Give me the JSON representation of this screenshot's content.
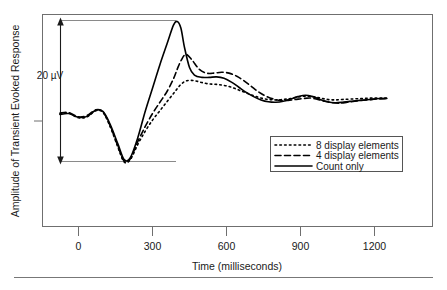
{
  "figure": {
    "background_color": "#ffffff",
    "border_color": "#6f6f6f",
    "trace_color": "#000000"
  },
  "axes": {
    "x_title": "Time (milliseconds)",
    "y_title": "Amplitude of Transient Evoked Response",
    "x_ticks": [
      "0",
      "300",
      "600",
      "900",
      "1200"
    ]
  },
  "scalebar": {
    "label": "20 µV"
  },
  "legend": {
    "items": [
      {
        "label": "8 display elements",
        "style": "dotted"
      },
      {
        "label": "4 display elements",
        "style": "dashed"
      },
      {
        "label": "Count only",
        "style": "solid"
      }
    ]
  },
  "chart_data": {
    "type": "line",
    "title": "",
    "subtitle": "",
    "xlabel": "Time (milliseconds)",
    "ylabel": "Amplitude of Transient Evoked Response",
    "xlim": [
      -110,
      1290
    ],
    "ylim": [
      -12.5,
      22.5
    ],
    "xticks": [
      0,
      300,
      600,
      900,
      1200
    ],
    "yticks": [],
    "grid": false,
    "legend_position": "lower-right",
    "annotations": [
      {
        "text": "20 µV",
        "type": "scale-bar",
        "value": 20,
        "units": "µV",
        "x": -60,
        "y_from": -10.0,
        "y_to": 20.0
      }
    ],
    "series": [
      {
        "name": "Count only",
        "style": "solid",
        "x": [
          -75,
          -40,
          0,
          35,
          70,
          100,
          130,
          160,
          185,
          210,
          240,
          270,
          300,
          330,
          360,
          385,
          400,
          415,
          430,
          450,
          470,
          500,
          530,
          560,
          590,
          620,
          650,
          680,
          710,
          740,
          770,
          800,
          830,
          860,
          890,
          920,
          950,
          980,
          1010,
          1040,
          1070,
          1100,
          1140,
          1180,
          1220,
          1250
        ],
        "y": [
          0.0,
          0.2,
          -0.6,
          -0.4,
          0.9,
          0.6,
          -2.3,
          -6.3,
          -9.6,
          -9.2,
          -5.0,
          0.6,
          5.6,
          10.6,
          15.2,
          19.0,
          19.8,
          18.4,
          14.2,
          10.0,
          8.4,
          7.9,
          7.9,
          8.0,
          7.7,
          6.9,
          5.8,
          4.7,
          3.8,
          3.1,
          2.7,
          2.6,
          2.8,
          3.3,
          3.8,
          4.1,
          3.8,
          3.2,
          2.7,
          2.5,
          2.6,
          2.8,
          3.0,
          3.2,
          3.4,
          3.4
        ]
      },
      {
        "name": "4 display elements",
        "style": "dashed",
        "x": [
          -75,
          -40,
          0,
          35,
          70,
          100,
          130,
          160,
          185,
          210,
          240,
          270,
          300,
          330,
          360,
          385,
          400,
          415,
          435,
          460,
          490,
          520,
          550,
          580,
          610,
          640,
          670,
          700,
          730,
          760,
          790,
          820,
          850,
          880,
          910,
          940,
          970,
          1000,
          1030,
          1060,
          1090,
          1130,
          1170,
          1210,
          1250
        ],
        "y": [
          0.3,
          0.4,
          -0.5,
          -0.2,
          1.0,
          0.5,
          -2.6,
          -6.8,
          -9.9,
          -9.4,
          -5.8,
          -2.6,
          0.2,
          2.6,
          5.0,
          7.6,
          9.6,
          11.4,
          12.8,
          11.6,
          9.6,
          8.8,
          8.8,
          9.0,
          8.8,
          8.2,
          7.2,
          6.0,
          4.8,
          3.9,
          3.3,
          3.0,
          3.0,
          3.2,
          3.4,
          3.5,
          3.2,
          2.8,
          2.5,
          2.4,
          2.6,
          2.9,
          3.1,
          3.3,
          3.4
        ]
      },
      {
        "name": "8 display elements",
        "style": "dotted",
        "x": [
          -75,
          -40,
          0,
          35,
          70,
          100,
          130,
          160,
          185,
          210,
          240,
          270,
          300,
          330,
          360,
          390,
          415,
          440,
          470,
          500,
          530,
          560,
          590,
          620,
          650,
          680,
          710,
          740,
          770,
          800,
          830,
          860,
          890,
          920,
          950,
          980,
          1010,
          1040,
          1070,
          1110,
          1150,
          1190,
          1230,
          1250
        ],
        "y": [
          0.1,
          0.3,
          -0.7,
          -0.5,
          0.8,
          0.4,
          -2.8,
          -7.0,
          -10.1,
          -9.6,
          -6.4,
          -3.6,
          -1.2,
          0.8,
          2.8,
          4.8,
          6.4,
          7.2,
          7.2,
          6.8,
          6.5,
          6.4,
          6.2,
          5.8,
          5.2,
          4.6,
          4.0,
          3.5,
          3.2,
          3.1,
          3.2,
          3.4,
          3.7,
          3.9,
          3.8,
          3.5,
          3.2,
          3.1,
          3.2,
          3.3,
          3.4,
          3.5,
          3.5,
          3.5
        ]
      }
    ]
  }
}
